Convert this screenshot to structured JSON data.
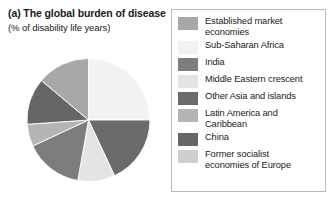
{
  "caption": {
    "title": "(a) The global burden of disease",
    "subtitle": "(% of disability life years)"
  },
  "chart_data": {
    "type": "pie",
    "title": "(a) The global burden of disease",
    "subtitle": "(% of disability life years)",
    "unit": "% of disability life years",
    "legend_position": "right",
    "grid": false,
    "start_angle_deg": 0,
    "direction": "clockwise",
    "categories": [
      "Established market economies",
      "Sub-Saharan Africa",
      "India",
      "Middle Eastern crescent",
      "Other Asia and islands",
      "Latin America and Caribbean",
      "China",
      "Former socialist economies of Europe"
    ],
    "values": [
      14,
      25,
      18,
      9,
      15,
      6,
      8,
      5
    ],
    "colors": [
      "#a8a8a8",
      "#f2f2f2",
      "#7d7d7d",
      "#e4e4e4",
      "#6b6b6b",
      "#b5b5b5",
      "#666666",
      "#cfcfcf"
    ],
    "slices": [
      {
        "label": "Sub-Saharan Africa",
        "value": 25,
        "color": "#f2f2f2",
        "start_deg": 0,
        "end_deg": 90
      },
      {
        "label": "Other Asia and islands",
        "value": 18,
        "color": "#6b6b6b",
        "start_deg": 90,
        "end_deg": 155
      },
      {
        "label": "Middle Eastern crescent",
        "value": 9,
        "color": "#e4e4e4",
        "start_deg": 155,
        "end_deg": 190
      },
      {
        "label": "India",
        "value": 15,
        "color": "#7d7d7d",
        "start_deg": 190,
        "end_deg": 245
      },
      {
        "label": "Latin America and Caribbean",
        "value": 6,
        "color": "#b5b5b5",
        "start_deg": 245,
        "end_deg": 266
      },
      {
        "label": "China",
        "value": 12,
        "color": "#666666",
        "start_deg": 266,
        "end_deg": 310
      },
      {
        "label": "Established market economies",
        "value": 14,
        "color": "#a8a8a8",
        "start_deg": 310,
        "end_deg": 360
      }
    ]
  },
  "legend": {
    "items": [
      {
        "label": "Established market\neconomies",
        "color": "#a8a8a8",
        "name": "established-market-economies"
      },
      {
        "label": "Sub-Saharan Africa",
        "color": "#f2f2f2",
        "name": "sub-saharan-africa"
      },
      {
        "label": "India",
        "color": "#7d7d7d",
        "name": "india"
      },
      {
        "label": "Middle Eastern crescent",
        "color": "#e4e4e4",
        "name": "middle-eastern-crescent"
      },
      {
        "label": "Other Asia and islands",
        "color": "#6b6b6b",
        "name": "other-asia-and-islands"
      },
      {
        "label": "Latin America and\nCaribbean",
        "color": "#b5b5b5",
        "name": "latin-america-and-caribbean"
      },
      {
        "label": "China",
        "color": "#666666",
        "name": "china"
      },
      {
        "label": "Former socialist\neconomies of Europe",
        "color": "#cfcfcf",
        "name": "former-socialist-economies-of-europe"
      }
    ]
  },
  "colors": {
    "background": "#ffffff",
    "text": "#1a1a1a",
    "legend_border": "#b9b9b9",
    "slice_stroke": "#ffffff"
  }
}
